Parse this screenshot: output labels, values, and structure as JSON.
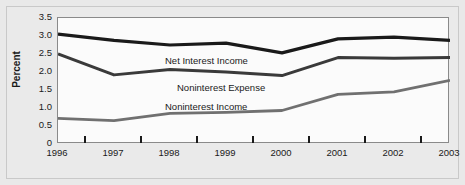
{
  "figure": {
    "background_color": "#e9e9e9",
    "plot_background_color": "#fbfbfb",
    "plot_border_color": "#8a8a8a"
  },
  "axis": {
    "ylabel": "Percent",
    "ytick_labels": [
      "3.5",
      "3.0",
      "2.5",
      "2.0",
      "1.5",
      "1.0",
      "0.5",
      "0"
    ],
    "xtick_labels": [
      "1996",
      "1997",
      "1998",
      "1999",
      "2000",
      "2001",
      "2002",
      "2003"
    ]
  },
  "series_labels": {
    "net_interest_income": "Net Interest Income",
    "noninterest_expense": "Noninterest Expense",
    "noninterest_income": "Noninterest Income"
  },
  "chart_data": {
    "type": "line",
    "title": "",
    "xlabel": "",
    "ylabel": "Percent",
    "categories": [
      "1996",
      "1997",
      "1998",
      "1999",
      "2000",
      "2001",
      "2002",
      "2003"
    ],
    "x": [
      1996,
      1997,
      1998,
      1999,
      2000,
      2001,
      2002,
      2003
    ],
    "ylim": [
      0,
      3.5
    ],
    "yticks": [
      0,
      0.5,
      1.0,
      1.5,
      2.0,
      2.5,
      3.0,
      3.5
    ],
    "grid": false,
    "legend": "inline-labels",
    "series": [
      {
        "name": "Net Interest Income",
        "color": "#1a1a1a",
        "line_width": 3.2,
        "values": [
          3.05,
          2.88,
          2.75,
          2.8,
          2.53,
          2.92,
          2.97,
          2.88
        ]
      },
      {
        "name": "Noninterest Expense",
        "color": "#3a3a3a",
        "line_width": 3.0,
        "values": [
          2.5,
          1.92,
          2.07,
          2.0,
          1.9,
          2.4,
          2.38,
          2.4
        ]
      },
      {
        "name": "Noninterest Income",
        "color": "#707070",
        "line_width": 2.8,
        "values": [
          0.71,
          0.65,
          0.85,
          0.88,
          0.93,
          1.38,
          1.45,
          1.77
        ]
      }
    ]
  }
}
